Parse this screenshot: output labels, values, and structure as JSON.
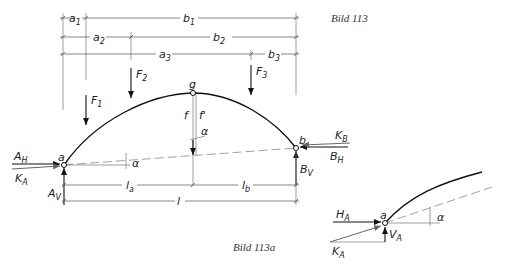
{
  "figure": {
    "main_caption": "Bild 113",
    "detail_caption": "Bild 113a"
  },
  "dimensions": {
    "row1": {
      "left": "a",
      "left_sub": "1",
      "right": "b",
      "right_sub": "1"
    },
    "row2": {
      "left": "a",
      "left_sub": "2",
      "right": "b",
      "right_sub": "2"
    },
    "row3": {
      "left": "a",
      "left_sub": "3",
      "right": "b",
      "right_sub": "3"
    },
    "span_left": {
      "main": "l",
      "sub": "a"
    },
    "span_right": {
      "main": "l",
      "sub": "b"
    },
    "span_total": "l"
  },
  "loads": [
    {
      "main": "F",
      "sub": "1"
    },
    {
      "main": "F",
      "sub": "2"
    },
    {
      "main": "F",
      "sub": "3"
    }
  ],
  "hinges": {
    "left": "a",
    "crown": "g",
    "right": "b"
  },
  "rise": {
    "f": "f",
    "f_prime": "f'"
  },
  "angle": "α",
  "reactions": {
    "AH": {
      "main": "A",
      "sub": "H"
    },
    "KA": {
      "main": "K",
      "sub": "A"
    },
    "AV": {
      "main": "A",
      "sub": "V"
    },
    "KB": {
      "main": "K",
      "sub": "B"
    },
    "BH": {
      "main": "B",
      "sub": "H"
    },
    "BV": {
      "main": "B",
      "sub": "V"
    }
  },
  "detail": {
    "hinge": "a",
    "HA": {
      "main": "H",
      "sub": "A"
    },
    "VA": {
      "main": "V",
      "sub": "A"
    },
    "KA": {
      "main": "K",
      "sub": "A"
    },
    "angle": "α"
  }
}
